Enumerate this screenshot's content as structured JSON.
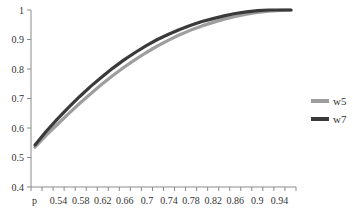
{
  "chart_data": {
    "type": "line",
    "title": "",
    "xlabel": "",
    "ylabel": "",
    "ylim": [
      0.4,
      1.0
    ],
    "yticks": [
      "0.4",
      "0.5",
      "0.6",
      "0.7",
      "0.8",
      "0.9",
      "1"
    ],
    "categories": [
      "p",
      "0.52",
      "0.54",
      "0.56",
      "0.58",
      "0.6",
      "0.62",
      "0.64",
      "0.66",
      "0.68",
      "0.7",
      "0.72",
      "0.74",
      "0.76",
      "0.78",
      "0.8",
      "0.82",
      "0.84",
      "0.86",
      "0.88",
      "0.9",
      "0.92",
      "0.94",
      "0.96"
    ],
    "xtick_labels_shown": [
      "p",
      "0.54",
      "0.58",
      "0.62",
      "0.66",
      "0.7",
      "0.74",
      "0.78",
      "0.82",
      "0.86",
      "0.9",
      "0.94"
    ],
    "grid": false,
    "legend_position": "right",
    "series": [
      {
        "name": "w5",
        "color": "#9e9e9e",
        "values": [
          0.535,
          0.575,
          0.612,
          0.648,
          0.683,
          0.716,
          0.748,
          0.778,
          0.806,
          0.832,
          0.856,
          0.878,
          0.898,
          0.916,
          0.932,
          0.946,
          0.958,
          0.969,
          0.978,
          0.986,
          0.992,
          0.996,
          0.999,
          1.0
        ]
      },
      {
        "name": "w7",
        "color": "#3a3a3a",
        "values": [
          0.542,
          0.588,
          0.63,
          0.669,
          0.706,
          0.741,
          0.773,
          0.803,
          0.831,
          0.856,
          0.879,
          0.9,
          0.918,
          0.934,
          0.948,
          0.961,
          0.971,
          0.98,
          0.988,
          0.994,
          0.998,
          1.0,
          1.0,
          1.0
        ]
      }
    ]
  }
}
